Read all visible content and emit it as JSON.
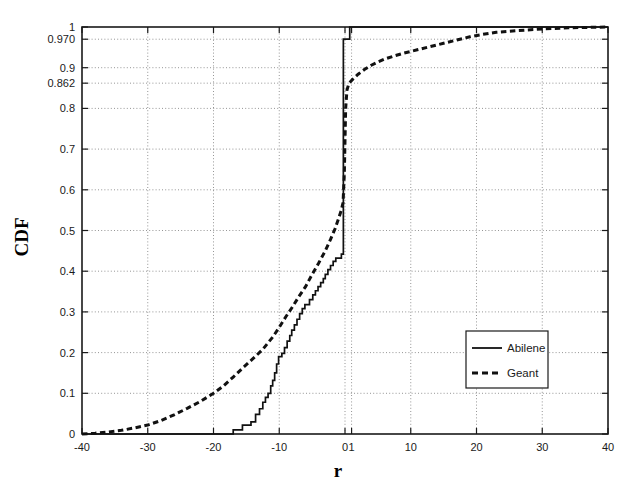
{
  "chart_data": {
    "type": "line",
    "title": "",
    "xlabel": "r",
    "ylabel": "CDF",
    "xlim": [
      -40,
      40
    ],
    "ylim": [
      0,
      1
    ],
    "grid": true,
    "legend_position": "lower-right",
    "x_ticks": [
      -40,
      -30,
      -20,
      -10,
      0,
      1,
      10,
      20,
      30,
      40
    ],
    "x_tick_labels": [
      "-40",
      "-30",
      "-20",
      "-10",
      "0",
      "1",
      "10",
      "20",
      "30",
      "40"
    ],
    "y_ticks": [
      0,
      0.1,
      0.2,
      0.3,
      0.4,
      0.5,
      0.6,
      0.7,
      0.8,
      0.862,
      0.9,
      0.97,
      1
    ],
    "y_tick_labels": [
      "0",
      "0.1",
      "0.2",
      "0.3",
      "0.4",
      "0.5",
      "0.6",
      "0.7",
      "0.8",
      "0.862",
      "0.9",
      "0.970",
      "1"
    ],
    "y_gridlines": [
      0.1,
      0.2,
      0.3,
      0.4,
      0.5,
      0.6,
      0.7,
      0.8,
      0.862,
      0.9,
      0.97
    ],
    "x_gridlines": [
      -30,
      -20,
      -10,
      0,
      1,
      10,
      20,
      30
    ],
    "series": [
      {
        "name": "Abilene",
        "style": "solid",
        "points": [
          [
            -40,
            0.0
          ],
          [
            -17.0,
            0.0
          ],
          [
            -17.0,
            0.01
          ],
          [
            -15.6,
            0.01
          ],
          [
            -15.6,
            0.022
          ],
          [
            -14.3,
            0.022
          ],
          [
            -14.3,
            0.03
          ],
          [
            -13.6,
            0.03
          ],
          [
            -13.6,
            0.048
          ],
          [
            -13.0,
            0.048
          ],
          [
            -13.0,
            0.062
          ],
          [
            -12.5,
            0.062
          ],
          [
            -12.5,
            0.078
          ],
          [
            -12.1,
            0.078
          ],
          [
            -12.1,
            0.09
          ],
          [
            -11.7,
            0.09
          ],
          [
            -11.7,
            0.1
          ],
          [
            -11.3,
            0.1
          ],
          [
            -11.3,
            0.118
          ],
          [
            -11.0,
            0.118
          ],
          [
            -11.0,
            0.132
          ],
          [
            -10.7,
            0.132
          ],
          [
            -10.7,
            0.15
          ],
          [
            -10.4,
            0.15
          ],
          [
            -10.4,
            0.172
          ],
          [
            -10.1,
            0.172
          ],
          [
            -10.1,
            0.19
          ],
          [
            -9.6,
            0.19
          ],
          [
            -9.6,
            0.198
          ],
          [
            -9.2,
            0.198
          ],
          [
            -9.2,
            0.212
          ],
          [
            -8.8,
            0.212
          ],
          [
            -8.8,
            0.228
          ],
          [
            -8.4,
            0.228
          ],
          [
            -8.4,
            0.242
          ],
          [
            -8.1,
            0.242
          ],
          [
            -8.1,
            0.255
          ],
          [
            -7.7,
            0.255
          ],
          [
            -7.7,
            0.268
          ],
          [
            -7.3,
            0.268
          ],
          [
            -7.3,
            0.282
          ],
          [
            -6.9,
            0.282
          ],
          [
            -6.9,
            0.296
          ],
          [
            -6.5,
            0.296
          ],
          [
            -6.5,
            0.308
          ],
          [
            -6.1,
            0.308
          ],
          [
            -6.1,
            0.318
          ],
          [
            -5.4,
            0.318
          ],
          [
            -5.4,
            0.33
          ],
          [
            -4.9,
            0.33
          ],
          [
            -4.9,
            0.342
          ],
          [
            -4.5,
            0.342
          ],
          [
            -4.5,
            0.352
          ],
          [
            -4.1,
            0.352
          ],
          [
            -4.1,
            0.362
          ],
          [
            -3.7,
            0.362
          ],
          [
            -3.7,
            0.372
          ],
          [
            -3.3,
            0.372
          ],
          [
            -3.3,
            0.382
          ],
          [
            -3.0,
            0.382
          ],
          [
            -3.0,
            0.392
          ],
          [
            -2.6,
            0.392
          ],
          [
            -2.6,
            0.404
          ],
          [
            -2.2,
            0.404
          ],
          [
            -2.2,
            0.414
          ],
          [
            -1.8,
            0.414
          ],
          [
            -1.8,
            0.424
          ],
          [
            -1.4,
            0.424
          ],
          [
            -1.4,
            0.432
          ],
          [
            -0.55,
            0.432
          ],
          [
            -0.55,
            0.442
          ],
          [
            -0.25,
            0.442
          ],
          [
            -0.25,
            0.97
          ],
          [
            0.72,
            0.97
          ],
          [
            0.72,
            1.0
          ],
          [
            40,
            1.0
          ]
        ]
      },
      {
        "name": "Geant",
        "style": "dashed",
        "points": [
          [
            -40,
            0.0
          ],
          [
            -38.0,
            0.002
          ],
          [
            -36.0,
            0.005
          ],
          [
            -34.0,
            0.009
          ],
          [
            -32.0,
            0.015
          ],
          [
            -30.0,
            0.022
          ],
          [
            -28.0,
            0.033
          ],
          [
            -26.0,
            0.047
          ],
          [
            -24.0,
            0.063
          ],
          [
            -22.0,
            0.08
          ],
          [
            -20.0,
            0.1
          ],
          [
            -18.5,
            0.118
          ],
          [
            -17.0,
            0.14
          ],
          [
            -15.5,
            0.163
          ],
          [
            -14.0,
            0.185
          ],
          [
            -12.5,
            0.208
          ],
          [
            -11.0,
            0.238
          ],
          [
            -10.0,
            0.262
          ],
          [
            -9.0,
            0.288
          ],
          [
            -8.0,
            0.312
          ],
          [
            -7.0,
            0.338
          ],
          [
            -6.0,
            0.362
          ],
          [
            -5.0,
            0.392
          ],
          [
            -4.0,
            0.42
          ],
          [
            -3.0,
            0.45
          ],
          [
            -2.2,
            0.478
          ],
          [
            -1.5,
            0.505
          ],
          [
            -1.0,
            0.528
          ],
          [
            -0.6,
            0.548
          ],
          [
            -0.3,
            0.568
          ],
          [
            -0.1,
            0.64
          ],
          [
            0.0,
            0.72
          ],
          [
            0.1,
            0.8
          ],
          [
            0.3,
            0.845
          ],
          [
            0.6,
            0.862
          ],
          [
            1.2,
            0.872
          ],
          [
            2.0,
            0.884
          ],
          [
            3.0,
            0.896
          ],
          [
            4.0,
            0.906
          ],
          [
            5.0,
            0.914
          ],
          [
            6.0,
            0.921
          ],
          [
            7.5,
            0.929
          ],
          [
            9.0,
            0.936
          ],
          [
            11.0,
            0.944
          ],
          [
            13.0,
            0.952
          ],
          [
            15.0,
            0.96
          ],
          [
            17.0,
            0.968
          ],
          [
            19.0,
            0.976
          ],
          [
            21.0,
            0.982
          ],
          [
            23.0,
            0.987
          ],
          [
            26.0,
            0.991
          ],
          [
            30.0,
            0.995
          ],
          [
            34.0,
            0.998
          ],
          [
            37.0,
            0.999
          ],
          [
            40.0,
            1.0
          ]
        ]
      }
    ],
    "legend": {
      "entries": [
        {
          "label": "Abilene",
          "style": "solid"
        },
        {
          "label": "Geant",
          "style": "dashed"
        }
      ]
    }
  }
}
